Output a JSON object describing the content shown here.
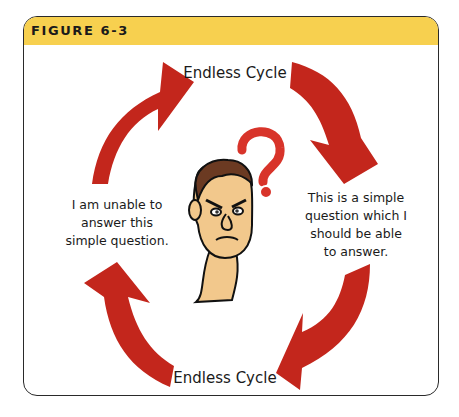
{
  "figure": {
    "title": "FIGURE 6-3",
    "header_color": "#f7d04f",
    "arrow_color": "#c3261c"
  },
  "diagram": {
    "type": "cycle",
    "top_label": "Endless Cycle",
    "bottom_label": "Endless Cycle",
    "right_text_lines": [
      "This is a simple",
      "question which I",
      "should be able",
      "to answer."
    ],
    "left_text_lines": [
      "I am unable to",
      "answer this",
      "simple question."
    ],
    "center_image": "puzzled-man-cartoon",
    "center_symbol": "?",
    "arrows": [
      "top-left-clockwise",
      "top-right-clockwise",
      "bottom-right-clockwise",
      "bottom-left-clockwise"
    ]
  }
}
